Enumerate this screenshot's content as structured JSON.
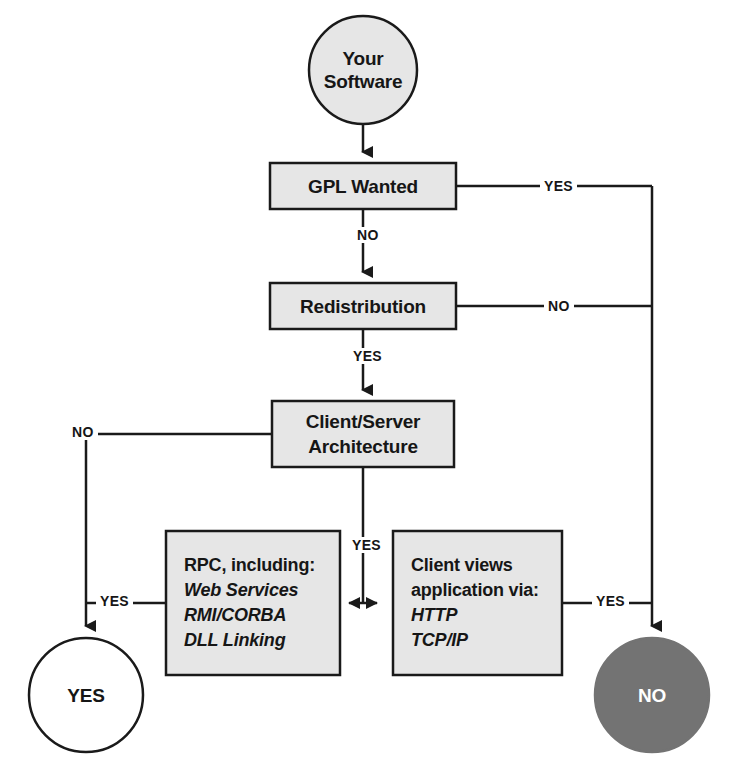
{
  "diagram": {
    "colors": {
      "node_fill": "#e6e6e6",
      "node_stroke": "#1a1a1a",
      "terminal_no_fill": "#737373",
      "terminal_yes_fill": "#ffffff",
      "line": "#1a1a1a",
      "text": "#161616",
      "text_inverse": "#ffffff"
    },
    "nodes": {
      "start": {
        "id": "your-software",
        "shape": "circle",
        "lines": [
          "Your",
          "Software"
        ]
      },
      "gpl_wanted": {
        "id": "gpl-wanted",
        "shape": "rect",
        "lines": [
          "GPL Wanted"
        ]
      },
      "redistribution": {
        "id": "redistribution",
        "shape": "rect",
        "lines": [
          "Redistribution"
        ]
      },
      "client_server": {
        "id": "client-server-architecture",
        "shape": "rect",
        "lines": [
          "Client/Server",
          "Architecture"
        ]
      },
      "rpc": {
        "id": "rpc-box",
        "shape": "rect",
        "heading": "RPC, including:",
        "items": [
          "Web Services",
          "RMI/CORBA",
          "DLL Linking"
        ]
      },
      "client_views": {
        "id": "client-views-box",
        "shape": "rect",
        "heading_lines": [
          "Client views",
          "application via:"
        ],
        "items": [
          "HTTP",
          "TCP/IP"
        ]
      },
      "terminal_yes": {
        "id": "terminal-yes",
        "shape": "circle",
        "lines": [
          "YES"
        ]
      },
      "terminal_no": {
        "id": "terminal-no",
        "shape": "circle",
        "lines": [
          "NO"
        ]
      }
    },
    "edges": [
      {
        "id": "start-to-gpl",
        "from": "your-software",
        "to": "gpl-wanted",
        "label": ""
      },
      {
        "id": "gpl-yes-to-no-terminal",
        "from": "gpl-wanted",
        "to": "terminal-no",
        "label": "YES"
      },
      {
        "id": "gpl-no-to-redistribution",
        "from": "gpl-wanted",
        "to": "redistribution",
        "label": "NO"
      },
      {
        "id": "redistribution-no-to-no-terminal",
        "from": "redistribution",
        "to": "terminal-no",
        "label": "NO"
      },
      {
        "id": "redistribution-yes-to-client-server",
        "from": "redistribution",
        "to": "client-server-architecture",
        "label": "YES"
      },
      {
        "id": "client-server-no-to-yes-terminal",
        "from": "client-server-architecture",
        "to": "terminal-yes",
        "label": "NO"
      },
      {
        "id": "rpc-to-yes-terminal",
        "from": "rpc-box",
        "to": "terminal-yes",
        "label": "YES"
      },
      {
        "id": "client-server-yes-to-boxes",
        "from": "client-server-architecture",
        "to": "rpc-box/client-views-box",
        "label": "YES"
      },
      {
        "id": "client-views-yes-to-no-terminal",
        "from": "client-views-box",
        "to": "terminal-no",
        "label": "YES"
      }
    ],
    "edge_labels": {
      "gpl_yes": "YES",
      "gpl_no": "NO",
      "redist_no": "NO",
      "redist_yes": "YES",
      "cs_no": "NO",
      "cs_yes": "YES",
      "rpc_yes": "YES",
      "views_yes": "YES"
    }
  }
}
